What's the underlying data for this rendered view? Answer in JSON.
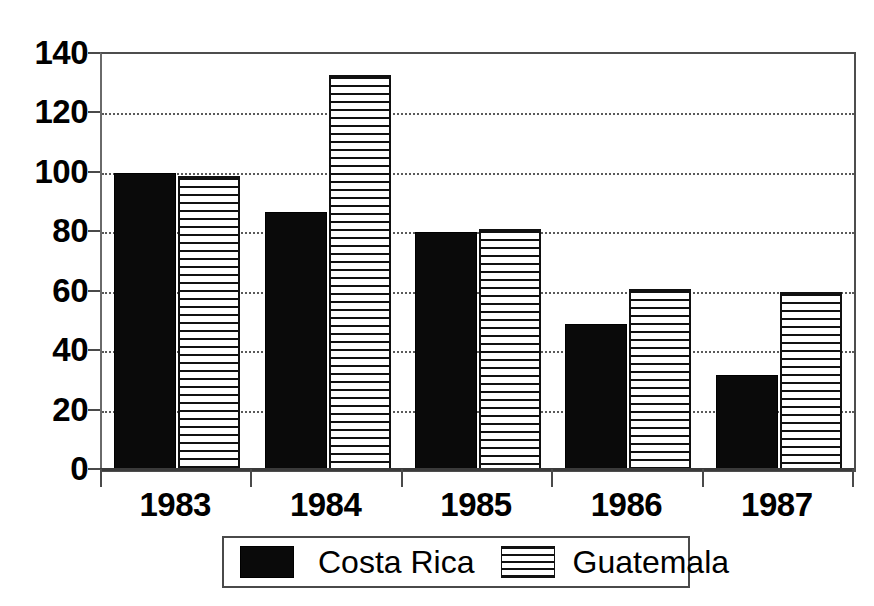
{
  "chart_data": {
    "type": "bar",
    "title": "",
    "subtitle": "",
    "xlabel": "",
    "ylabel": "",
    "categories": [
      "1983",
      "1984",
      "1985",
      "1986",
      "1987"
    ],
    "series": [
      {
        "name": "Costa Rica",
        "values": [
          100,
          87,
          80,
          49,
          32
        ],
        "fill": "solid-black",
        "color": "#0a0a0a"
      },
      {
        "name": "Guatemala",
        "values": [
          99,
          133,
          81,
          61,
          60
        ],
        "fill": "horizontal-hatch",
        "color": "#ffffff"
      }
    ],
    "ylim": [
      0,
      140
    ],
    "yticks": [
      0,
      20,
      40,
      60,
      80,
      100,
      120,
      140
    ],
    "ytick_labels": [
      "0",
      "20",
      "40",
      "60",
      "80",
      "100",
      "120",
      "140"
    ],
    "grid": "horizontal-dotted",
    "legend_position": "bottom-center",
    "annotations": []
  },
  "legend": {
    "entries": [
      {
        "label": "Costa Rica",
        "swatch": "solid-black-swatch"
      },
      {
        "label": "Guatemala",
        "swatch": "horizontal-hatch-swatch"
      }
    ]
  },
  "colors": {
    "series_1": "#0a0a0a",
    "series_2": "#ffffff",
    "hatch": "#111111",
    "axis": "#4a4a4a",
    "grid": "#5a5a5a",
    "background": "#ffffff"
  }
}
